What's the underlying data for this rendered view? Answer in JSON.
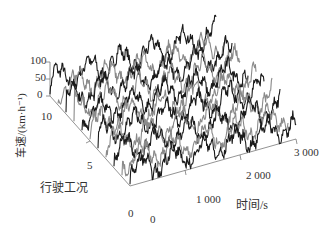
{
  "chart_data": {
    "type": "line",
    "subtype": "3d-waterfall",
    "title": "",
    "xlabel": "时间/s",
    "ylabel": "行驶工况",
    "zlabel": "车速/(km·h⁻¹)",
    "x_ticks": [
      "0",
      "1 000",
      "2 000",
      "3 000"
    ],
    "y_ticks": [
      "0",
      "5",
      "10"
    ],
    "z_ticks": [
      "0",
      "50",
      "100"
    ],
    "xlim": [
      0,
      3000
    ],
    "ylim": [
      0,
      10
    ],
    "zlim": [
      0,
      100
    ],
    "grid": false,
    "legend": null,
    "series_count": 11,
    "series": [
      {
        "name": "工况0",
        "color": "#1a1a1a"
      },
      {
        "name": "工况1",
        "color": "#8a8a8a"
      },
      {
        "name": "工况2",
        "color": "#1a1a1a"
      },
      {
        "name": "工况3",
        "color": "#8a8a8a"
      },
      {
        "name": "工况4",
        "color": "#1a1a1a"
      },
      {
        "name": "工况5",
        "color": "#8a8a8a"
      },
      {
        "name": "工况6",
        "color": "#1a1a1a"
      },
      {
        "name": "工况7",
        "color": "#8a8a8a"
      },
      {
        "name": "工况8",
        "color": "#1a1a1a"
      },
      {
        "name": "工况9",
        "color": "#8a8a8a"
      },
      {
        "name": "工况10",
        "color": "#1a1a1a"
      }
    ]
  },
  "labels": {
    "zlabel": "车速/(km·h⁻¹)",
    "z100": "100",
    "z50": "50",
    "z0": "0",
    "y10": "10",
    "y5": "5",
    "y0": "0",
    "ylabel": "行驶工况",
    "x0": "0",
    "x1000": "1 000",
    "x2000": "2 000",
    "x3000": "3 000",
    "xlabel": "时间/s"
  }
}
